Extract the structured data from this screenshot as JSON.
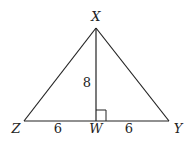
{
  "diagram": {
    "type": "triangle",
    "stroke_color": "#222222",
    "background": "#ffffff",
    "vertices": {
      "X": {
        "label": "X",
        "x": 96,
        "y": 28
      },
      "Z": {
        "label": "Z",
        "x": 24,
        "y": 121
      },
      "Y": {
        "label": "Y",
        "x": 169,
        "y": 121
      },
      "W": {
        "label": "W",
        "x": 96,
        "y": 121
      }
    },
    "segments": [
      {
        "from": "X",
        "to": "Z"
      },
      {
        "from": "X",
        "to": "Y"
      },
      {
        "from": "Z",
        "to": "Y"
      },
      {
        "from": "X",
        "to": "W",
        "note": "altitude"
      }
    ],
    "measures": {
      "XW": "8",
      "ZW": "6",
      "WY": "6"
    },
    "right_angle_at": "W"
  }
}
